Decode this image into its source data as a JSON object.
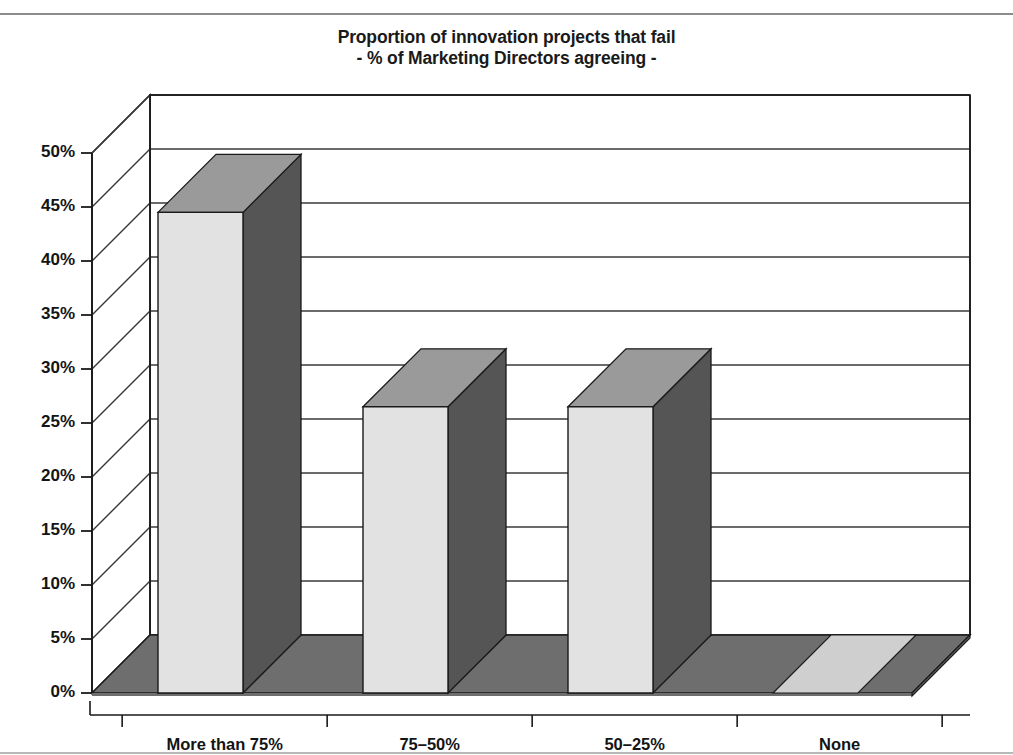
{
  "chart_data": {
    "type": "bar",
    "title": "Proportion of innovation projects that fail",
    "subtitle": "- % of Marketing Directors agreeing -",
    "xlabel": "",
    "ylabel": "",
    "categories": [
      "More than 75%",
      "75–50%",
      "50–25%",
      "None"
    ],
    "values": [
      44.5,
      26.5,
      26.5,
      0
    ],
    "series": [
      {
        "name": "% of Marketing Directors agreeing",
        "values": [
          44.5,
          26.5,
          26.5,
          0
        ]
      }
    ],
    "ylim": [
      0,
      50
    ],
    "ytick_values": [
      0,
      5,
      10,
      15,
      20,
      25,
      30,
      35,
      40,
      45,
      50
    ],
    "ytick_labels": [
      "0%",
      "5%",
      "10%",
      "15%",
      "20%",
      "25%",
      "30%",
      "35%",
      "40%",
      "45%",
      "50%"
    ],
    "grid": true,
    "grid_axis": "y",
    "legend": false,
    "legend_position": "none",
    "style": "3d-column",
    "colors": {
      "bar_front": "#e2e2e2",
      "bar_top": "#9a9a9a",
      "bar_side": "#555555",
      "floor": "#6e6e6e",
      "floor_top": "#cfcfcf",
      "outline": "#1a1a1a",
      "gridline": "#3a3a3a",
      "text": "#141414",
      "background": "#ffffff"
    }
  }
}
